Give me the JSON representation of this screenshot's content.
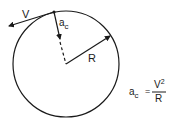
{
  "diagram": {
    "labels": {
      "velocity": "V",
      "accel_a": "a",
      "accel_sub": "c",
      "radius": "R"
    },
    "formula": {
      "lhs_a": "a",
      "lhs_sub": "c",
      "equals": "=",
      "numerator": "V",
      "numerator_exp": "2",
      "denominator": "R"
    },
    "colors": {
      "ink": "#1a1a1a",
      "background": "#ffffff"
    }
  }
}
